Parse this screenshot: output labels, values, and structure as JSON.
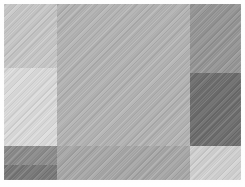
{
  "figure": {
    "width": 245,
    "height": 187,
    "background_color": "#ffffff",
    "texture": "diagonal-weave",
    "margins": {
      "left": 4,
      "top": 4,
      "right": 4,
      "bottom": 7
    }
  },
  "chart_data": {
    "type": "heatmap",
    "subtitle": "",
    "xlabel": "",
    "ylabel": "",
    "grid": false,
    "legend": "none",
    "colormap": "gray",
    "value_range": [
      110,
      220
    ],
    "xlim": [
      0,
      245
    ],
    "ylim": [
      0,
      187
    ],
    "categories": [
      "top-left",
      "mid-left",
      "center",
      "top-right",
      "mid-right",
      "bottom-left-upper",
      "bottom-left-lower",
      "bottom-center",
      "bottom-right"
    ],
    "values": [
      200,
      220,
      180,
      150,
      110,
      140,
      120,
      168,
      210
    ],
    "cells": [
      {
        "name": "top-left",
        "color": "#c8c8c8",
        "gray_value": 200,
        "x": 4,
        "y": 4,
        "width": 53,
        "height": 64
      },
      {
        "name": "mid-left",
        "color": "#dcdcdc",
        "gray_value": 220,
        "x": 4,
        "y": 68,
        "width": 53,
        "height": 78
      },
      {
        "name": "center",
        "color": "#b4b4b4",
        "gray_value": 180,
        "x": 57,
        "y": 4,
        "width": 133,
        "height": 142
      },
      {
        "name": "top-right",
        "color": "#969696",
        "gray_value": 150,
        "x": 190,
        "y": 4,
        "width": 51,
        "height": 69
      },
      {
        "name": "mid-right",
        "color": "#6e6e6e",
        "gray_value": 110,
        "x": 190,
        "y": 73,
        "width": 51,
        "height": 73
      },
      {
        "name": "bottom-left-upper",
        "color": "#8c8c8c",
        "gray_value": 140,
        "x": 4,
        "y": 146,
        "width": 53,
        "height": 19
      },
      {
        "name": "bottom-left-lower",
        "color": "#787878",
        "gray_value": 120,
        "x": 4,
        "y": 165,
        "width": 53,
        "height": 15
      },
      {
        "name": "bottom-center",
        "color": "#a8a8a8",
        "gray_value": 168,
        "x": 57,
        "y": 146,
        "width": 133,
        "height": 34
      },
      {
        "name": "bottom-right",
        "color": "#d2d2d2",
        "gray_value": 210,
        "x": 190,
        "y": 146,
        "width": 51,
        "height": 34
      }
    ]
  }
}
